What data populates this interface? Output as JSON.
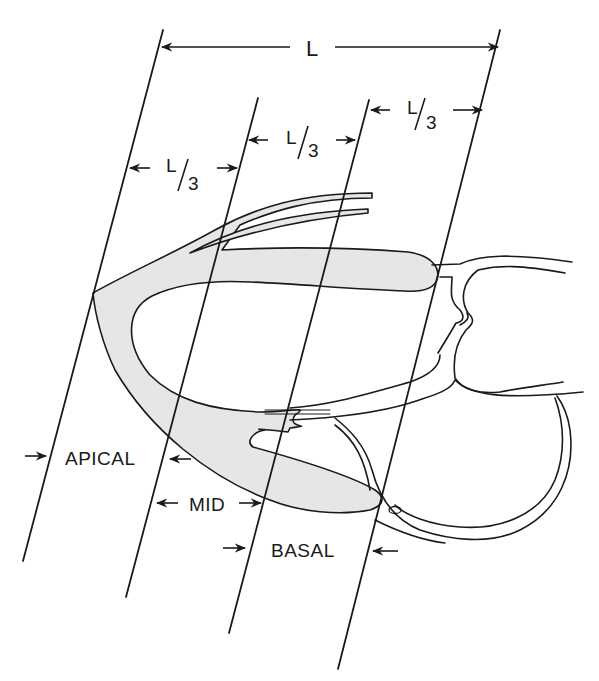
{
  "figure": {
    "total_length_label": "L",
    "third_labels": [
      {
        "numerator": "L",
        "denominator": "3"
      },
      {
        "numerator": "L",
        "denominator": "3"
      },
      {
        "numerator": "L",
        "denominator": "3"
      }
    ],
    "segments": [
      {
        "name": "apical",
        "label": "APICAL"
      },
      {
        "name": "mid",
        "label": "MID"
      },
      {
        "name": "basal",
        "label": "BASAL"
      }
    ],
    "colors": {
      "ink": "#1a1a1a",
      "myocardium_fill": "#e6e6e6",
      "background": "#ffffff"
    }
  }
}
